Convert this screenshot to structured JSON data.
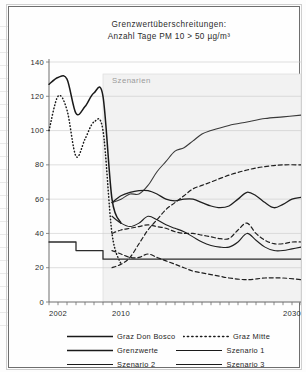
{
  "chart_data": {
    "type": "line",
    "title": "Grenzwertüberschreitungen:",
    "subtitle": "Anzahl Tage PM 10 > 50 µg/m³",
    "xlabel": "",
    "ylabel": "",
    "xlim": [
      2002,
      2030
    ],
    "ylim": [
      0,
      140
    ],
    "grid": true,
    "legend_position": "bottom",
    "xticks": [
      2002,
      2003,
      2004,
      2005,
      2006,
      2007,
      2008,
      2009,
      2010,
      2011,
      2012,
      2013,
      2014,
      2015,
      2016,
      2017,
      2018,
      2019,
      2020,
      2021,
      2022,
      2023,
      2024,
      2025,
      2026,
      2027,
      2028,
      2029,
      2030
    ],
    "xtick_labels": [
      "2002",
      "2010",
      "2030"
    ],
    "xtick_label_values": [
      2002,
      2010,
      2030
    ],
    "yticks": [
      0,
      20,
      40,
      60,
      80,
      100,
      120,
      140
    ],
    "ytick_labels": [
      "0",
      "20",
      "40",
      "60",
      "80",
      "100",
      "120",
      "140"
    ],
    "annotations": [
      {
        "text": "Szenarien",
        "x": 2009.0,
        "y": 128,
        "region_x0": 2008,
        "region_x1": 2030,
        "region_y0": 0,
        "region_y1": 133
      }
    ],
    "series": [
      {
        "name": "Graz Don Bosco",
        "style": "solid",
        "color": "#1a1a1a",
        "width": 1.5,
        "x": [
          2002,
          2003,
          2004,
          2005,
          2006,
          2007,
          2008,
          2009,
          2010
        ],
        "values": [
          127,
          131,
          130,
          110,
          114,
          122,
          120,
          60,
          46
        ]
      },
      {
        "name": "Graz Mitte",
        "style": "dotted",
        "color": "#1a1a1a",
        "width": 1.5,
        "x": [
          2002,
          2003,
          2004,
          2005,
          2006,
          2007,
          2008,
          2009,
          2010
        ],
        "values": [
          100,
          120,
          112,
          85,
          95,
          105,
          100,
          40,
          22
        ]
      },
      {
        "name": "Grenzwerte",
        "style": "solid-step",
        "color": "#2b2b2b",
        "width": 1.3,
        "x": [
          2002,
          2004,
          2005,
          2007,
          2008,
          2030
        ],
        "values": [
          35,
          35,
          30,
          30,
          25,
          25
        ]
      },
      {
        "name": "Szenario 1",
        "style": "solid",
        "color": "#3a3a3a",
        "width": 1.1,
        "x": [
          2009,
          2010,
          2011,
          2012,
          2013,
          2014,
          2015,
          2016,
          2017,
          2018,
          2019,
          2020,
          2022,
          2024,
          2026,
          2028,
          2030
        ],
        "values": [
          58,
          60,
          63,
          63,
          68,
          76,
          82,
          88,
          90,
          94,
          98,
          100,
          103,
          105,
          107,
          108,
          109
        ]
      },
      {
        "name": "Szenario 2",
        "style": "solid",
        "color": "#1f1f1f",
        "width": 1.3,
        "x": [
          2009,
          2010,
          2011,
          2012,
          2013,
          2014,
          2015,
          2016,
          2017,
          2018,
          2019,
          2020,
          2021,
          2022,
          2023,
          2024,
          2025,
          2026,
          2027,
          2028,
          2029,
          2030
        ],
        "values": [
          58,
          62,
          64,
          65,
          65,
          63,
          60,
          59,
          60,
          60,
          58,
          56,
          55,
          56,
          60,
          64,
          62,
          58,
          55,
          57,
          60,
          61
        ]
      },
      {
        "name": "Szenario 3",
        "style": "solid",
        "color": "#1f1f1f",
        "width": 1.1,
        "x": [
          2009,
          2010,
          2011,
          2012,
          2013,
          2014,
          2015,
          2016,
          2017,
          2018,
          2019,
          2020,
          2021,
          2022,
          2023,
          2024,
          2025,
          2026,
          2027,
          2028,
          2029,
          2030
        ],
        "values": [
          50,
          46,
          44,
          46,
          50,
          48,
          45,
          43,
          41,
          38,
          35,
          33,
          32,
          32,
          35,
          40,
          36,
          32,
          30,
          30,
          31,
          32
        ]
      },
      {
        "name": "Szenario 1 (Variante, gestrichelt)",
        "style": "dashed",
        "color": "#1f1f1f",
        "width": 1.2,
        "x": [
          2009,
          2010,
          2011,
          2012,
          2013,
          2014,
          2015,
          2016,
          2017,
          2018,
          2019,
          2020,
          2022,
          2024,
          2026,
          2028,
          2030
        ],
        "values": [
          20,
          22,
          26,
          34,
          42,
          48,
          54,
          58,
          62,
          66,
          68,
          70,
          74,
          77,
          79,
          80,
          80
        ]
      },
      {
        "name": "Szenario 2 (Variante, gestrichelt)",
        "style": "dashed",
        "color": "#1f1f1f",
        "width": 1.2,
        "x": [
          2009,
          2010,
          2011,
          2012,
          2013,
          2014,
          2015,
          2016,
          2017,
          2018,
          2019,
          2020,
          2021,
          2022,
          2023,
          2024,
          2025,
          2026,
          2027,
          2028,
          2029,
          2030
        ],
        "values": [
          40,
          42,
          43,
          44,
          45,
          44,
          43,
          41,
          40,
          40,
          39,
          38,
          37,
          37,
          42,
          46,
          40,
          36,
          34,
          34,
          35,
          35
        ]
      },
      {
        "name": "Szenario 3 (Variante, gestrichelt)",
        "style": "dashed",
        "color": "#1f1f1f",
        "width": 1.2,
        "x": [
          2009,
          2010,
          2011,
          2012,
          2013,
          2014,
          2015,
          2016,
          2017,
          2018,
          2019,
          2020,
          2021,
          2022,
          2024,
          2026,
          2028,
          2030
        ],
        "values": [
          30,
          28,
          26,
          26,
          28,
          26,
          24,
          22,
          20,
          18,
          17,
          16,
          15,
          14,
          13,
          14,
          14,
          13
        ]
      }
    ]
  },
  "legend": {
    "entries": [
      {
        "label": "Graz Don Bosco",
        "style": "solid",
        "width": 1.6
      },
      {
        "label": "Graz Mitte",
        "style": "dotted",
        "width": 1.6
      },
      {
        "label": "Grenzwerte",
        "style": "solid",
        "width": 1.4
      },
      {
        "label": "Szenario 1",
        "style": "solid",
        "width": 1.0
      },
      {
        "label": "Szenario 2",
        "style": "solid",
        "width": 1.2
      },
      {
        "label": "Szenario 3",
        "style": "solid",
        "width": 1.0
      }
    ]
  },
  "colors": {
    "line": "#1a1a1a",
    "grid": "#c9c9c9",
    "axis": "#6e6e6e",
    "shaded_region": "#f2f2f2",
    "frame": "#6e6e6e",
    "text": "#2b2b2b"
  }
}
